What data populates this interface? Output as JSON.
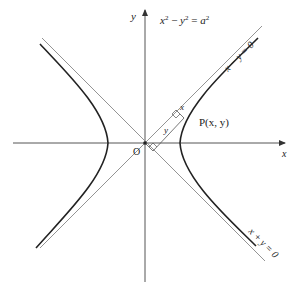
{
  "diagram": {
    "title_equation": "x² − y² = a²",
    "equation_parts": {
      "x": "x",
      "minus": " − ",
      "y": "y",
      "eq": " = ",
      "a": "a",
      "sup": "2"
    },
    "axes": {
      "x_label": "x",
      "y_label": "y",
      "origin_label": "O"
    },
    "asymptotes": [
      {
        "label": "x − y = 0",
        "slope": 1
      },
      {
        "label": "x + y = 0",
        "slope": -1
      }
    ],
    "point": {
      "label": "P(x, y)"
    },
    "distance_labels": {
      "perp_to_asymptote": "x",
      "along_asymptote": "y"
    },
    "colors": {
      "curve": "#222222",
      "axis": "#555555",
      "asymptote": "#888888",
      "text": "#222222"
    }
  }
}
